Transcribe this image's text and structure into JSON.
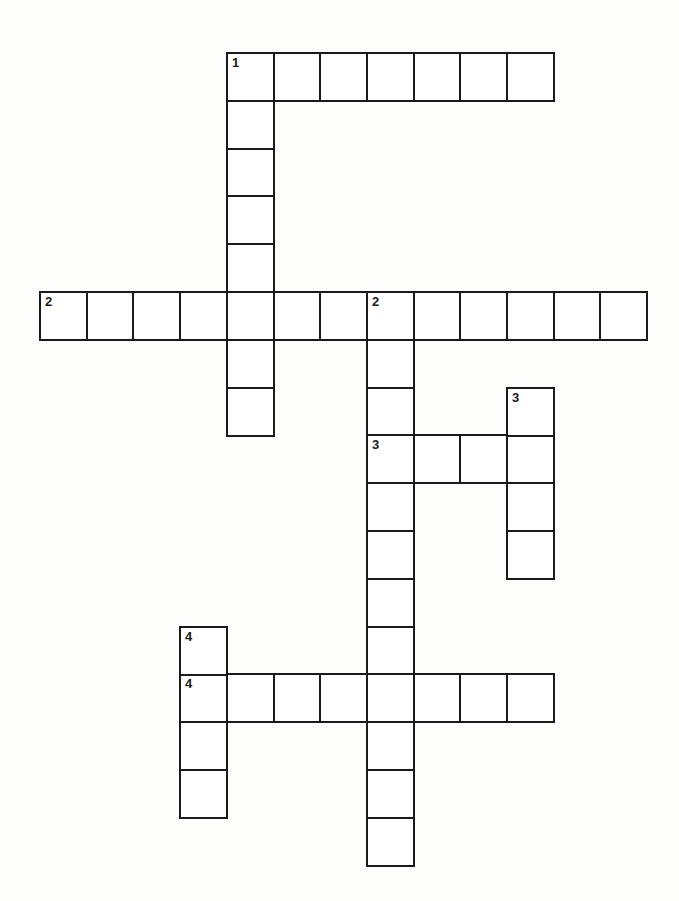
{
  "puzzle": {
    "type": "crossword",
    "grid": {
      "origin_x": 39,
      "origin_y": 52,
      "cell_w": 46.7,
      "cell_h": 47.8,
      "border_color": "#1a1a1a",
      "fill_color": "#ffffff"
    },
    "entries": [
      {
        "number": "1",
        "direction": "across",
        "row": 0,
        "col": 4,
        "length": 7
      },
      {
        "number": "1",
        "direction": "down",
        "row": 0,
        "col": 4,
        "length": 8
      },
      {
        "number": "2",
        "direction": "across",
        "row": 5,
        "col": 0,
        "length": 13
      },
      {
        "number": "2",
        "direction": "down",
        "row": 5,
        "col": 7,
        "length": 12
      },
      {
        "number": "3",
        "direction": "across",
        "row": 8,
        "col": 7,
        "length": 4
      },
      {
        "number": "3",
        "direction": "down",
        "row": 7,
        "col": 10,
        "length": 4
      },
      {
        "number": "4",
        "direction": "across",
        "row": 13,
        "col": 3,
        "length": 8
      },
      {
        "number": "4",
        "direction": "down",
        "row": 12,
        "col": 3,
        "length": 4
      }
    ]
  }
}
